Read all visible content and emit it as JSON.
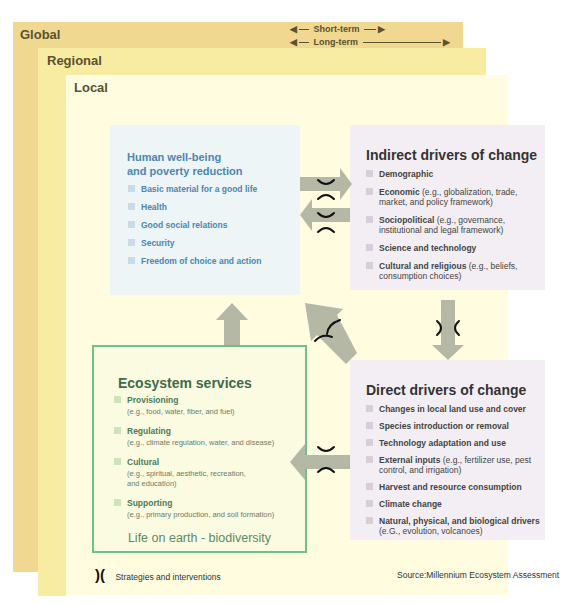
{
  "scales": {
    "global": "Global",
    "regional": "Regional",
    "local": "Local",
    "short_term": "Short-term",
    "long_term": "Long-term"
  },
  "human_wellbeing": {
    "title_line1": "Human well-being",
    "title_line2": "and poverty reduction",
    "items": [
      "Basic material for a good life",
      "Health",
      "Good social relations",
      "Security",
      "Freedom of choice and action"
    ]
  },
  "indirect_drivers": {
    "title": "Indirect drivers of change",
    "items": [
      {
        "label": "Demographic",
        "detail": ""
      },
      {
        "label": "Economic",
        "detail": " (e.g., globalization, trade, market, and policy framework)"
      },
      {
        "label": "Sociopolitical",
        "detail": " (e.g., governance, institutional and legal framework)"
      },
      {
        "label": "Science and technology",
        "detail": ""
      },
      {
        "label": "Cultural and religious",
        "detail": " (e.g., beliefs, consumption choices)"
      }
    ]
  },
  "direct_drivers": {
    "title": "Direct drivers of change",
    "items": [
      {
        "label": "Changes in local land use and cover",
        "detail": ""
      },
      {
        "label": "Species introduction or removal",
        "detail": ""
      },
      {
        "label": "Technology adaptation and use",
        "detail": ""
      },
      {
        "label": "External inputs",
        "detail": " (e.g., fertilizer use, pest control, and irrigation)"
      },
      {
        "label": "Harvest and resource consumption",
        "detail": ""
      },
      {
        "label": "Climate change",
        "detail": ""
      },
      {
        "label": "Natural, physical, and biological drivers",
        "detail": " (e.G., evolution, volcanoes)"
      }
    ]
  },
  "ecosystem_services": {
    "title": "Ecosystem services",
    "items": [
      {
        "label": "Provisioning",
        "detail": "(e.g., food, water, fiber, and fuel)"
      },
      {
        "label": "Regulating",
        "detail": "(e.g., climate regulation, water, and disease)"
      },
      {
        "label": "Cultural",
        "detail": "(e.g., spiritual, aesthetic, recreation, and education)"
      },
      {
        "label": "Supporting",
        "detail": "(e.g., primary production, and soil formation)"
      }
    ],
    "footer": "Life on earth - biodiversity"
  },
  "legend": {
    "symbol": ")(",
    "label": "Strategies and interventions"
  },
  "source": "Source:Millennium Ecosystem Assessment",
  "colors": {
    "global": "#f0d890",
    "regional": "#f8eba2",
    "local": "#fffce0",
    "arrow": "#b4b8a4",
    "eco_border": "#6cc38a",
    "hwb_text": "#4a86b4"
  }
}
